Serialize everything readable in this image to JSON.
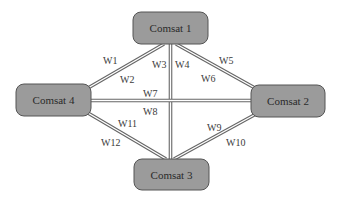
{
  "diagram": {
    "style": {
      "node_fill": "#9b9b9b",
      "node_stroke": "#555555",
      "link_outer": "#666666",
      "link_inner": "#ffffff",
      "background": "#ffffff"
    },
    "nodes": [
      {
        "id": "c1",
        "label": "Comsat 1",
        "x": 133,
        "y": 12,
        "w": 75,
        "h": 32
      },
      {
        "id": "c2",
        "label": "Comsat 2",
        "x": 251,
        "y": 85,
        "w": 74,
        "h": 32
      },
      {
        "id": "c3",
        "label": "Comsat 3",
        "x": 134,
        "y": 159,
        "w": 75,
        "h": 31
      },
      {
        "id": "c4",
        "label": "Comsat 4",
        "x": 16,
        "y": 84,
        "w": 75,
        "h": 32
      }
    ],
    "links": [
      {
        "id": "c1-c4",
        "from": "Comsat 1",
        "to": "Comsat 4",
        "x1": 164,
        "y1": 44,
        "x2": 88,
        "y2": 88,
        "labels": [
          "W1",
          "W2"
        ]
      },
      {
        "id": "c1-c3",
        "from": "Comsat 1",
        "to": "Comsat 3",
        "x1": 170.5,
        "y1": 44,
        "x2": 170.5,
        "y2": 159,
        "labels": [
          "W3",
          "W4"
        ]
      },
      {
        "id": "c1-c2",
        "from": "Comsat 1",
        "to": "Comsat 2",
        "x1": 176,
        "y1": 44,
        "x2": 255,
        "y2": 88,
        "labels": [
          "W5",
          "W6"
        ]
      },
      {
        "id": "c4-c2",
        "from": "Comsat 4",
        "to": "Comsat 2",
        "x1": 91,
        "y1": 100.5,
        "x2": 251,
        "y2": 100.5,
        "labels": [
          "W7",
          "W8"
        ]
      },
      {
        "id": "c2-c3",
        "from": "Comsat 2",
        "to": "Comsat 3",
        "x1": 256,
        "y1": 114,
        "x2": 174,
        "y2": 159,
        "labels": [
          "W9",
          "W10"
        ]
      },
      {
        "id": "c4-c3",
        "from": "Comsat 4",
        "to": "Comsat 3",
        "x1": 88,
        "y1": 113,
        "x2": 166,
        "y2": 159,
        "labels": [
          "W11",
          "W12"
        ]
      }
    ],
    "link_labels": [
      {
        "text": "W1",
        "x": 103,
        "y": 64
      },
      {
        "text": "W2",
        "x": 120,
        "y": 83
      },
      {
        "text": "W3",
        "x": 152,
        "y": 68
      },
      {
        "text": "W4",
        "x": 175,
        "y": 68
      },
      {
        "text": "W5",
        "x": 219,
        "y": 64
      },
      {
        "text": "W6",
        "x": 201,
        "y": 82
      },
      {
        "text": "W7",
        "x": 143,
        "y": 97
      },
      {
        "text": "W8",
        "x": 143,
        "y": 115
      },
      {
        "text": "W9",
        "x": 207,
        "y": 131
      },
      {
        "text": "W10",
        "x": 226,
        "y": 146
      },
      {
        "text": "W11",
        "x": 118,
        "y": 127
      },
      {
        "text": "W12",
        "x": 101,
        "y": 146
      }
    ]
  }
}
